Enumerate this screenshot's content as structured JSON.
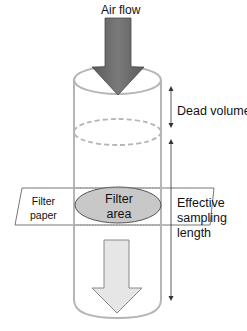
{
  "diagram": {
    "labels": {
      "air_flow": "Air flow",
      "dead_volume": "Dead volume",
      "effective_line1": "Effective",
      "effective_line2": "sampling",
      "effective_line3": "length",
      "filter_paper_line1": "Filter",
      "filter_paper_line2": "paper",
      "filter_area_line1": "Filter",
      "filter_area_line2": "area"
    },
    "colors": {
      "cylinder_stroke": "#b5b5b5",
      "inlet_arrow_fill": "#6b6b6b",
      "outlet_arrow_fill": "#e6e6e6",
      "filter_area_fill": "#c8c8c8",
      "dimension_line": "#333333"
    }
  }
}
